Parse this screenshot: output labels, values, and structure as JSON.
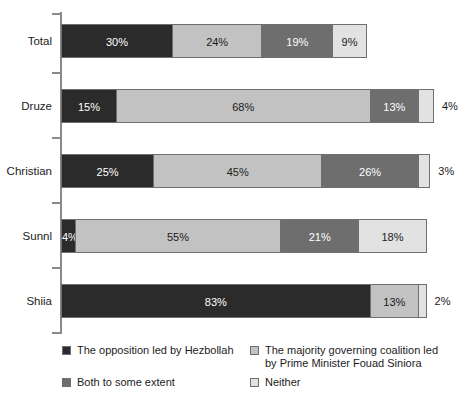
{
  "chart_data": {
    "type": "bar",
    "orientation": "horizontal",
    "stacked": true,
    "title": "",
    "subtitle": "",
    "xlabel": "",
    "ylabel": "",
    "xlim": [
      0,
      100
    ],
    "grid": false,
    "legend_position": "bottom",
    "categories": [
      "Total",
      "Druze",
      "Christian",
      "Sunnl",
      "Shiia"
    ],
    "series": [
      {
        "name": "The opposition led by Hezbollah",
        "color": "#2b2b2b",
        "values": [
          30,
          15,
          25,
          4,
          83
        ],
        "labels": [
          "30%",
          "15%",
          "25%",
          "4%",
          "83%"
        ]
      },
      {
        "name": "The majority governing coalition led by Prime Minister Fouad Siniora",
        "color": "#c2c2c2",
        "values": [
          24,
          68,
          45,
          55,
          13
        ],
        "labels": [
          "24%",
          "68%",
          "45%",
          "55%",
          "13%"
        ]
      },
      {
        "name": "Both to some extent",
        "color": "#6e6e6e",
        "values": [
          19,
          13,
          26,
          21,
          0
        ],
        "labels": [
          "19%",
          "13%",
          "26%",
          "21%",
          ""
        ]
      },
      {
        "name": "Neither",
        "color": "#e2e2e2",
        "values": [
          9,
          4,
          3,
          18,
          2
        ],
        "labels": [
          "9%",
          "4%",
          "3%",
          "18%",
          "2%"
        ]
      }
    ]
  },
  "axis": {
    "tick_count": 6
  },
  "rows": [
    {
      "label": "Total",
      "segments": [
        {
          "value": 30,
          "label": "30%",
          "tone": "dark",
          "fill": "fill-dark",
          "inside": true
        },
        {
          "value": 24,
          "label": "24%",
          "tone": "light",
          "fill": "fill-light",
          "inside": true
        },
        {
          "value": 19,
          "label": "19%",
          "tone": "mid",
          "fill": "fill-mid",
          "inside": true
        },
        {
          "value": 9,
          "label": "9%",
          "tone": "pale",
          "fill": "fill-pale",
          "inside": true
        }
      ]
    },
    {
      "label": "Druze",
      "segments": [
        {
          "value": 15,
          "label": "15%",
          "tone": "dark",
          "fill": "fill-dark",
          "inside": true
        },
        {
          "value": 68,
          "label": "68%",
          "tone": "light",
          "fill": "fill-light",
          "inside": true
        },
        {
          "value": 13,
          "label": "13%",
          "tone": "mid",
          "fill": "fill-mid",
          "inside": true
        },
        {
          "value": 4,
          "label": "4%",
          "tone": "pale",
          "fill": "fill-pale",
          "inside": false
        }
      ]
    },
    {
      "label": "Christian",
      "segments": [
        {
          "value": 25,
          "label": "25%",
          "tone": "dark",
          "fill": "fill-dark",
          "inside": true
        },
        {
          "value": 45,
          "label": "45%",
          "tone": "light",
          "fill": "fill-light",
          "inside": true
        },
        {
          "value": 26,
          "label": "26%",
          "tone": "mid",
          "fill": "fill-mid",
          "inside": true
        },
        {
          "value": 3,
          "label": "3%",
          "tone": "pale",
          "fill": "fill-pale",
          "inside": false
        }
      ]
    },
    {
      "label": "Sunnl",
      "segments": [
        {
          "value": 4,
          "label": "4%",
          "tone": "dark",
          "fill": "fill-dark",
          "inside": true
        },
        {
          "value": 55,
          "label": "55%",
          "tone": "light",
          "fill": "fill-light",
          "inside": true
        },
        {
          "value": 21,
          "label": "21%",
          "tone": "mid",
          "fill": "fill-mid",
          "inside": true
        },
        {
          "value": 18,
          "label": "18%",
          "tone": "pale",
          "fill": "fill-pale",
          "inside": true
        }
      ]
    },
    {
      "label": "Shiia",
      "segments": [
        {
          "value": 83,
          "label": "83%",
          "tone": "dark",
          "fill": "fill-dark",
          "inside": true
        },
        {
          "value": 13,
          "label": "13%",
          "tone": "light",
          "fill": "fill-light",
          "inside": true
        },
        {
          "value": 2,
          "label": "2%",
          "tone": "pale",
          "fill": "fill-pale",
          "inside": false
        }
      ]
    }
  ],
  "legend": {
    "items": [
      {
        "label": "The opposition led by Hezbollah",
        "fill": "fill-dark",
        "swatch_name": "legend-swatch-opposition"
      },
      {
        "label": "The majority governing coalition led by Prime Minister Fouad Siniora",
        "fill": "fill-light",
        "swatch_name": "legend-swatch-majority"
      },
      {
        "label": "Both to some extent",
        "fill": "fill-mid",
        "swatch_name": "legend-swatch-both"
      },
      {
        "label": "Neither",
        "fill": "fill-pale",
        "swatch_name": "legend-swatch-neither"
      }
    ]
  }
}
